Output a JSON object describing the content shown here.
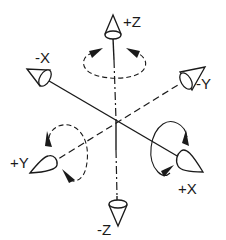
{
  "diagram": {
    "title": "",
    "type": "coordinate-axes-rotation",
    "center": [
      117,
      120
    ],
    "axes": [
      {
        "id": "pos-z",
        "label": "+Z",
        "style": "solid"
      },
      {
        "id": "neg-z",
        "label": "-Z",
        "style": "dashed"
      },
      {
        "id": "neg-x",
        "label": "-X",
        "style": "solid"
      },
      {
        "id": "pos-x",
        "label": "+X",
        "style": "solid"
      },
      {
        "id": "neg-y",
        "label": "-Y",
        "style": "dashed"
      },
      {
        "id": "pos-y",
        "label": "+Y",
        "style": "dashed"
      }
    ],
    "rotation_indicators": [
      {
        "axis": "Z",
        "style": "dashed",
        "arrows": 2
      },
      {
        "axis": "X",
        "style": "solid",
        "arrows": 2
      },
      {
        "axis": "Y",
        "style": "dashed",
        "arrows": 2
      }
    ],
    "colors": {
      "stroke": "#1a1a1a",
      "background": "#ffffff"
    }
  }
}
